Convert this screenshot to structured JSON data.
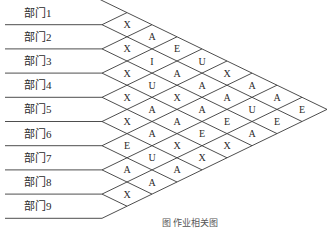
{
  "departments": [
    "部门1",
    "部门2",
    "部门3",
    "部门4",
    "部门5",
    "部门6",
    "部门7",
    "部门8",
    "部门9"
  ],
  "relationship_matrix": [
    {
      "pair": [
        1,
        2
      ],
      "code": "X"
    },
    {
      "pair": [
        2,
        3
      ],
      "code": "X"
    },
    {
      "pair": [
        3,
        4
      ],
      "code": "X"
    },
    {
      "pair": [
        4,
        5
      ],
      "code": "X"
    },
    {
      "pair": [
        5,
        6
      ],
      "code": "X"
    },
    {
      "pair": [
        6,
        7
      ],
      "code": "E"
    },
    {
      "pair": [
        7,
        8
      ],
      "code": "A"
    },
    {
      "pair": [
        8,
        9
      ],
      "code": "X"
    },
    {
      "pair": [
        1,
        3
      ],
      "code": "A"
    },
    {
      "pair": [
        2,
        4
      ],
      "code": "I"
    },
    {
      "pair": [
        3,
        5
      ],
      "code": "U"
    },
    {
      "pair": [
        4,
        6
      ],
      "code": "A"
    },
    {
      "pair": [
        5,
        7
      ],
      "code": "A"
    },
    {
      "pair": [
        6,
        8
      ],
      "code": "U"
    },
    {
      "pair": [
        7,
        9
      ],
      "code": "A"
    },
    {
      "pair": [
        1,
        4
      ],
      "code": "E"
    },
    {
      "pair": [
        2,
        5
      ],
      "code": "A"
    },
    {
      "pair": [
        3,
        6
      ],
      "code": "X"
    },
    {
      "pair": [
        4,
        7
      ],
      "code": "A"
    },
    {
      "pair": [
        5,
        8
      ],
      "code": "X"
    },
    {
      "pair": [
        6,
        9
      ],
      "code": "A"
    },
    {
      "pair": [
        1,
        5
      ],
      "code": "U"
    },
    {
      "pair": [
        2,
        6
      ],
      "code": "A"
    },
    {
      "pair": [
        3,
        7
      ],
      "code": "A"
    },
    {
      "pair": [
        4,
        8
      ],
      "code": "E"
    },
    {
      "pair": [
        5,
        9
      ],
      "code": "X"
    },
    {
      "pair": [
        1,
        6
      ],
      "code": "X"
    },
    {
      "pair": [
        2,
        7
      ],
      "code": "A"
    },
    {
      "pair": [
        3,
        8
      ],
      "code": "E"
    },
    {
      "pair": [
        4,
        9
      ],
      "code": "X"
    },
    {
      "pair": [
        1,
        7
      ],
      "code": "A"
    },
    {
      "pair": [
        2,
        8
      ],
      "code": "U"
    },
    {
      "pair": [
        3,
        9
      ],
      "code": "A"
    },
    {
      "pair": [
        1,
        8
      ],
      "code": "A"
    },
    {
      "pair": [
        2,
        9
      ],
      "code": "E"
    },
    {
      "pair": [
        1,
        9
      ],
      "code": "E"
    }
  ],
  "caption": "图  作业相关图"
}
